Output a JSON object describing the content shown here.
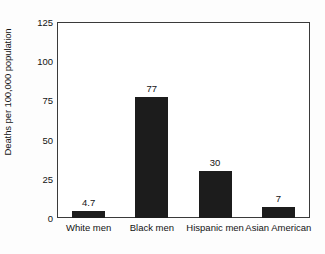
{
  "chart_data": {
    "type": "bar",
    "title": "",
    "xlabel": "",
    "ylabel": "Deaths per 100,000 population",
    "categories": [
      "White men",
      "Black men",
      "Hispanic men",
      "Asian American"
    ],
    "values": [
      4.7,
      77,
      30,
      7
    ],
    "value_labels": [
      "4.7",
      "77",
      "30",
      "7"
    ],
    "ylim": [
      0,
      125
    ],
    "yticks": [
      0,
      25,
      50,
      75,
      100,
      125
    ],
    "ytick_labels": [
      "0",
      "25",
      "50",
      "75",
      "100",
      "125"
    ],
    "grid": false,
    "legend": null,
    "bar_color": "#1c1c1c",
    "frame_color": "#3a3a3a",
    "background": "#ffffff"
  }
}
